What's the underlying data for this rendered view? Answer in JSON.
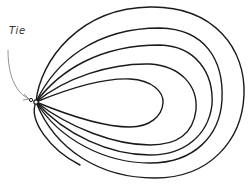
{
  "diagram": {
    "title": "",
    "annotation": {
      "label": "Tie",
      "target": "knot at junction of loops"
    },
    "loops": [
      {
        "name": "outer-loop",
        "order": 1
      },
      {
        "name": "loop-2",
        "order": 2
      },
      {
        "name": "loop-3",
        "order": 3
      },
      {
        "name": "loop-4",
        "order": 4
      },
      {
        "name": "inner-loop",
        "order": 5
      }
    ],
    "colors": {
      "stroke": "#1a1a1a",
      "arrow": "#777777",
      "background": "#ffffff"
    }
  }
}
